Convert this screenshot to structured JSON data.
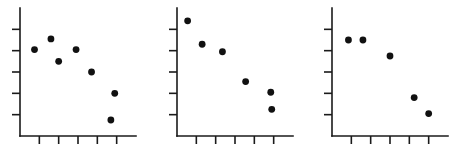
{
  "figure": {
    "title": "",
    "background_color": "#ffffff",
    "marker_color": "#111111",
    "axis_color": "#1a1a1a",
    "panel_count": 3
  },
  "chart_data": [
    {
      "type": "scatter",
      "title": "",
      "xlabel": "",
      "ylabel": "",
      "xlim": [
        0,
        6
      ],
      "ylim": [
        0,
        6
      ],
      "xticks": [
        1,
        2,
        3,
        4,
        5
      ],
      "yticks": [
        1,
        2,
        3,
        4,
        5
      ],
      "xticklabels": [
        "",
        "",
        "",
        "",
        ""
      ],
      "yticklabels": [
        "",
        "",
        "",
        "",
        ""
      ],
      "grid": false,
      "legend": null,
      "x": [
        0.75,
        1.6,
        2.0,
        2.9,
        3.7,
        4.9,
        4.7
      ],
      "y": [
        4.05,
        4.55,
        3.5,
        4.05,
        3.0,
        2.0,
        0.75
      ],
      "points": [
        {
          "x": 0.75,
          "y": 4.05
        },
        {
          "x": 1.6,
          "y": 4.55
        },
        {
          "x": 2.0,
          "y": 3.5
        },
        {
          "x": 2.9,
          "y": 4.05
        },
        {
          "x": 3.7,
          "y": 3.0
        },
        {
          "x": 4.9,
          "y": 2.0
        },
        {
          "x": 4.7,
          "y": 0.75
        }
      ]
    },
    {
      "type": "scatter",
      "title": "",
      "xlabel": "",
      "ylabel": "",
      "xlim": [
        0,
        6
      ],
      "ylim": [
        0,
        6
      ],
      "xticks": [
        1,
        2,
        3,
        4,
        5
      ],
      "yticks": [
        1,
        2,
        3,
        4,
        5
      ],
      "xticklabels": [
        "",
        "",
        "",
        "",
        ""
      ],
      "yticklabels": [
        "",
        "",
        "",
        "",
        ""
      ],
      "grid": false,
      "legend": null,
      "x": [
        0.55,
        1.3,
        2.35,
        3.55,
        4.85,
        4.9
      ],
      "y": [
        5.4,
        4.3,
        3.95,
        2.55,
        2.05,
        1.25
      ],
      "points": [
        {
          "x": 0.55,
          "y": 5.4
        },
        {
          "x": 1.3,
          "y": 4.3
        },
        {
          "x": 2.35,
          "y": 3.95
        },
        {
          "x": 3.55,
          "y": 2.55
        },
        {
          "x": 4.85,
          "y": 2.05
        },
        {
          "x": 4.9,
          "y": 1.25
        }
      ]
    },
    {
      "type": "scatter",
      "title": "",
      "xlabel": "",
      "ylabel": "",
      "xlim": [
        0,
        6
      ],
      "ylim": [
        0,
        6
      ],
      "xticks": [
        1,
        2,
        3,
        4,
        5
      ],
      "yticks": [
        1,
        2,
        3,
        4,
        5
      ],
      "xticklabels": [
        "",
        "",
        "",
        "",
        ""
      ],
      "yticklabels": [
        "",
        "",
        "",
        "",
        ""
      ],
      "grid": false,
      "legend": null,
      "x": [
        0.85,
        1.6,
        3.0,
        4.25,
        5.0
      ],
      "y": [
        4.5,
        4.5,
        3.75,
        1.8,
        1.05
      ],
      "points": [
        {
          "x": 0.85,
          "y": 4.5
        },
        {
          "x": 1.6,
          "y": 4.5
        },
        {
          "x": 3.0,
          "y": 3.75
        },
        {
          "x": 4.25,
          "y": 1.8
        },
        {
          "x": 5.0,
          "y": 1.05
        }
      ]
    }
  ],
  "panels": [
    {
      "name": "panel-left",
      "left": 8
    },
    {
      "name": "panel-middle",
      "left": 165
    },
    {
      "name": "panel-right",
      "left": 320
    }
  ]
}
